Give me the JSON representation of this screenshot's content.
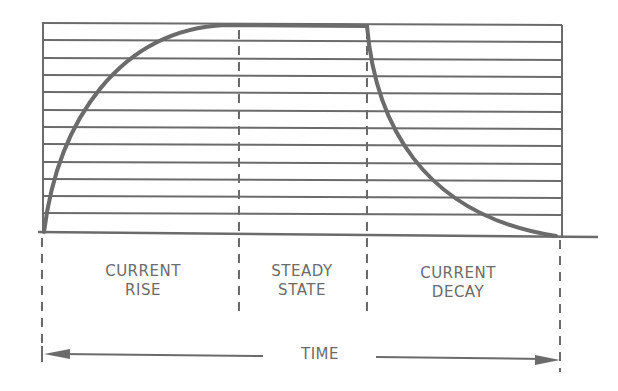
{
  "colors": {
    "ink": "#6b6b6b",
    "background": "#ffffff"
  },
  "phases": [
    {
      "id": "rise",
      "line1": "CURRENT",
      "line2": "RISE"
    },
    {
      "id": "steady",
      "line1": "STEADY",
      "line2": "STATE"
    },
    {
      "id": "decay",
      "line1": "CURRENT",
      "line2": "DECAY"
    }
  ],
  "time_axis": {
    "label": "TIME"
  },
  "grid": {
    "horizontal_lines": 12
  }
}
